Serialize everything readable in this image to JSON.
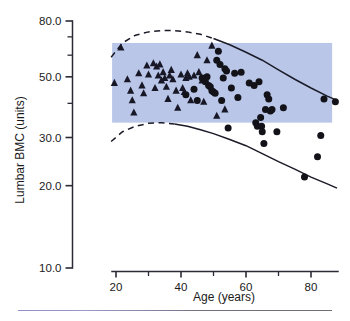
{
  "figure": {
    "background_color": "#ffffff",
    "band_color": "#b9c6e8",
    "marker_color": "#121218"
  },
  "axes": {
    "y": {
      "label": "Lumbar BMC (units)",
      "scale": "log",
      "major_ticks": [
        "80.0",
        "50.0",
        "30.0",
        "20.0",
        "10.0"
      ],
      "major_values": [
        80,
        50,
        30,
        20,
        10
      ],
      "minor_values": [
        70,
        60,
        40
      ],
      "range": [
        10,
        90
      ]
    },
    "x": {
      "label": "Age (years)",
      "scale": "linear",
      "major_ticks": [
        "20",
        "40",
        "60",
        "80"
      ],
      "major_values": [
        20,
        40,
        60,
        80
      ],
      "minor_values": [
        30,
        50,
        70
      ],
      "range": [
        17,
        89
      ]
    }
  },
  "chart_data": {
    "type": "scatter",
    "title": "",
    "xlabel": "Age (years)",
    "ylabel": "Lumbar BMC (units)",
    "xscale": "linear",
    "yscale": "log",
    "xlim": [
      17,
      89
    ],
    "ylim": [
      10,
      90
    ],
    "grid": false,
    "legend": "none",
    "series": [
      {
        "name": "triangles",
        "marker": "triangle",
        "color": "#171726",
        "points": [
          [
            19.5,
            47.5
          ],
          [
            21.5,
            64.0
          ],
          [
            23.5,
            49.0
          ],
          [
            24.5,
            44.5
          ],
          [
            25.0,
            41.0
          ],
          [
            25.5,
            37.0
          ],
          [
            27.0,
            51.5
          ],
          [
            28.0,
            46.5
          ],
          [
            28.5,
            43.5
          ],
          [
            29.5,
            55.0
          ],
          [
            30.0,
            51.0
          ],
          [
            31.5,
            56.0
          ],
          [
            32.0,
            45.5
          ],
          [
            32.5,
            54.5
          ],
          [
            33.0,
            50.5
          ],
          [
            33.5,
            55.5
          ],
          [
            34.0,
            48.5
          ],
          [
            34.5,
            52.0
          ],
          [
            35.0,
            49.5
          ],
          [
            35.5,
            46.0
          ],
          [
            36.0,
            41.5
          ],
          [
            36.5,
            50.5
          ],
          [
            37.0,
            53.0
          ],
          [
            37.5,
            49.0
          ],
          [
            38.5,
            44.5
          ],
          [
            39.0,
            38.5
          ],
          [
            40.0,
            51.0
          ],
          [
            40.5,
            45.5
          ],
          [
            41.0,
            44.0
          ],
          [
            41.5,
            49.5
          ],
          [
            42.0,
            51.5
          ],
          [
            42.5,
            50.0
          ],
          [
            43.0,
            41.0
          ],
          [
            44.0,
            50.5
          ],
          [
            45.0,
            60.0
          ],
          [
            45.5,
            52.0
          ],
          [
            46.5,
            48.5
          ],
          [
            47.0,
            40.5
          ],
          [
            48.0,
            57.5
          ],
          [
            49.5,
            65.0
          ],
          [
            51.0,
            36.0
          ],
          [
            53.5,
            38.0
          ]
        ]
      },
      {
        "name": "circles",
        "marker": "circle",
        "color": "#121218",
        "points": [
          [
            41.5,
            43.0
          ],
          [
            44.0,
            45.0
          ],
          [
            45.0,
            41.0
          ],
          [
            46.5,
            49.5
          ],
          [
            47.5,
            48.0
          ],
          [
            48.0,
            50.0
          ],
          [
            48.5,
            46.5
          ],
          [
            49.0,
            46.0
          ],
          [
            49.5,
            44.5
          ],
          [
            50.0,
            44.0
          ],
          [
            50.5,
            43.5
          ],
          [
            51.0,
            57.5
          ],
          [
            51.5,
            62.0
          ],
          [
            52.0,
            55.5
          ],
          [
            52.5,
            41.0
          ],
          [
            53.0,
            49.5
          ],
          [
            53.5,
            53.5
          ],
          [
            54.0,
            52.5
          ],
          [
            54.5,
            32.5
          ],
          [
            55.5,
            45.5
          ],
          [
            56.5,
            51.5
          ],
          [
            57.5,
            42.0
          ],
          [
            58.5,
            52.0
          ],
          [
            61.0,
            47.5
          ],
          [
            62.5,
            46.5
          ],
          [
            63.0,
            34.0
          ],
          [
            63.5,
            33.0
          ],
          [
            64.0,
            48.0
          ],
          [
            64.5,
            35.5
          ],
          [
            64.8,
            33.0
          ],
          [
            65.0,
            31.5
          ],
          [
            65.5,
            28.5
          ],
          [
            66.0,
            38.0
          ],
          [
            66.5,
            43.0
          ],
          [
            67.0,
            41.5
          ],
          [
            67.5,
            37.5
          ],
          [
            68.0,
            38.0
          ],
          [
            69.5,
            31.5
          ],
          [
            71.5,
            38.5
          ],
          [
            78.0,
            21.5
          ],
          [
            82.0,
            25.5
          ],
          [
            83.0,
            30.5
          ],
          [
            84.0,
            41.5
          ],
          [
            87.5,
            40.5
          ]
        ]
      }
    ],
    "reference_band": {
      "x_range": [
        18.8,
        86.5
      ],
      "y_range": [
        34.0,
        66.5
      ],
      "color": "#b9c6e8",
      "description": "shaded normal reference rectangle"
    },
    "curves": [
      {
        "name": "upper-percentile",
        "style": "dashed-then-solid",
        "description": "upper reference percentile curve, dashed below age 50, solid after",
        "points": [
          [
            18.5,
            59.0
          ],
          [
            22,
            66.5
          ],
          [
            26,
            71.0
          ],
          [
            30,
            73.0
          ],
          [
            34,
            73.8
          ],
          [
            38,
            73.8
          ],
          [
            42,
            73.0
          ],
          [
            46,
            71.5
          ],
          [
            50,
            69.0
          ],
          [
            55,
            65.5
          ],
          [
            60,
            61.5
          ],
          [
            65,
            57.5
          ],
          [
            70,
            53.0
          ],
          [
            75,
            49.0
          ],
          [
            80,
            45.5
          ],
          [
            85,
            42.5
          ],
          [
            88,
            41.0
          ]
        ]
      },
      {
        "name": "lower-percentile",
        "style": "dashed-then-solid",
        "description": "lower reference percentile curve, dashed below age 36, solid after",
        "points": [
          [
            18.5,
            29.0
          ],
          [
            22,
            31.5
          ],
          [
            26,
            33.0
          ],
          [
            30,
            33.8
          ],
          [
            34,
            34.0
          ],
          [
            38,
            33.6
          ],
          [
            42,
            33.0
          ],
          [
            46,
            32.0
          ],
          [
            50,
            31.0
          ],
          [
            55,
            29.5
          ],
          [
            60,
            28.0
          ],
          [
            65,
            26.2
          ],
          [
            70,
            24.5
          ],
          [
            75,
            23.0
          ],
          [
            80,
            21.5
          ],
          [
            85,
            20.3
          ],
          [
            88,
            19.6
          ]
        ]
      }
    ]
  }
}
